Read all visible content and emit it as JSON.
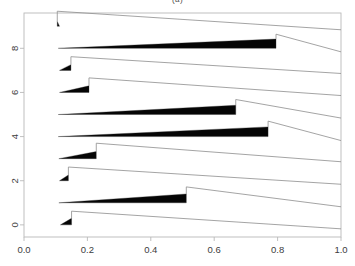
{
  "figure": {
    "title": "(a)",
    "background_color": "#ffffff",
    "frame_color": "#b9b9b9",
    "wedge_color": "#050505",
    "tail_color": "#8d8d8d"
  },
  "chart_data": {
    "type": "area",
    "title": "(a)",
    "xlabel": "",
    "ylabel": "",
    "xlim": [
      0.0,
      1.0
    ],
    "ylim": [
      9.6,
      -0.55
    ],
    "grid": false,
    "legend": null,
    "xticks": [
      0.0,
      0.2,
      0.4,
      0.6,
      0.8,
      1.0
    ],
    "xtick_labels": [
      "0.0",
      "0.2",
      "0.4",
      "0.6",
      "0.8",
      "1.0"
    ],
    "yticks": [
      0,
      2,
      4,
      6,
      8
    ],
    "ytick_labels": [
      "0",
      "2",
      "4",
      "6",
      "8"
    ],
    "ytick_rotation": 90,
    "series": [
      {
        "name": "row-0",
        "baseline": 0,
        "x_start": 0.115,
        "x_drop": 0.15,
        "max_thickness": 0.3,
        "drop_depth": 0.62,
        "x_end": 1.0,
        "y_end": -0.18
      },
      {
        "name": "row-1",
        "baseline": 1,
        "x_start": 0.11,
        "x_drop": 0.512,
        "max_thickness": 0.4,
        "drop_depth": 0.72,
        "x_end": 1.0,
        "y_end": 0.82
      },
      {
        "name": "row-2",
        "baseline": 2,
        "x_start": 0.112,
        "x_drop": 0.14,
        "max_thickness": 0.26,
        "drop_depth": 0.62,
        "x_end": 1.0,
        "y_end": 1.84
      },
      {
        "name": "row-3",
        "baseline": 3,
        "x_start": 0.11,
        "x_drop": 0.228,
        "max_thickness": 0.32,
        "drop_depth": 0.7,
        "x_end": 1.0,
        "y_end": 2.86
      },
      {
        "name": "row-4",
        "baseline": 4,
        "x_start": 0.108,
        "x_drop": 0.77,
        "max_thickness": 0.44,
        "drop_depth": 0.7,
        "x_end": 1.0,
        "y_end": 3.82
      },
      {
        "name": "row-5",
        "baseline": 5,
        "x_start": 0.108,
        "x_drop": 0.668,
        "max_thickness": 0.42,
        "drop_depth": 0.68,
        "x_end": 1.0,
        "y_end": 4.84
      },
      {
        "name": "row-6",
        "baseline": 6,
        "x_start": 0.112,
        "x_drop": 0.205,
        "max_thickness": 0.3,
        "drop_depth": 0.66,
        "x_end": 1.0,
        "y_end": 5.86
      },
      {
        "name": "row-7",
        "baseline": 7,
        "x_start": 0.112,
        "x_drop": 0.148,
        "max_thickness": 0.26,
        "drop_depth": 0.62,
        "x_end": 1.0,
        "y_end": 6.86
      },
      {
        "name": "row-8",
        "baseline": 8,
        "x_start": 0.108,
        "x_drop": 0.795,
        "max_thickness": 0.42,
        "drop_depth": 0.64,
        "x_end": 1.0,
        "y_end": 7.84
      },
      {
        "name": "row-9",
        "baseline": 9,
        "x_start": 0.112,
        "x_drop": 0.105,
        "max_thickness": 0.22,
        "drop_depth": 0.68,
        "x_end": 1.0,
        "y_end": 8.84
      }
    ]
  }
}
